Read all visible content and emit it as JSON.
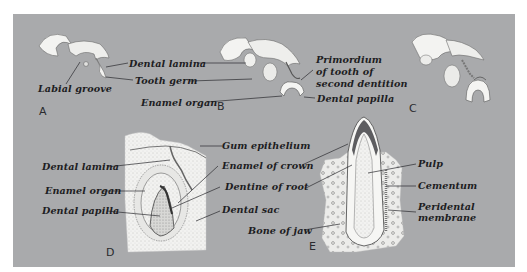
{
  "diagram": {
    "background_color": "#a9aaac",
    "panels": [
      {
        "id": "A",
        "label": "A",
        "annotations": [
          "Labial groove",
          "Dental lamina",
          "Tooth germ"
        ]
      },
      {
        "id": "B",
        "label": "B",
        "annotations": [
          "Enamel organ",
          "Primordium of tooth of second dentition",
          "Dental papilla"
        ]
      },
      {
        "id": "C",
        "label": "C",
        "annotations": []
      },
      {
        "id": "D",
        "label": "D",
        "annotations": [
          "Dental lamina",
          "Enamel organ",
          "Dental papilla",
          "Gum epithelium",
          "Enamel of crown",
          "Dentine of root",
          "Dental sac"
        ]
      },
      {
        "id": "E",
        "label": "E",
        "annotations": [
          "Pulp",
          "Cementum",
          "Peridental membrane",
          "Bone of jaw"
        ]
      }
    ]
  },
  "labels": {
    "labial_groove": "Labial groove",
    "dental_lamina_top": "Dental lamina",
    "tooth_germ": "Tooth germ",
    "enamel_organ_top": "Enamel organ",
    "primordium_1": "Primordium",
    "primordium_2": "of tooth of",
    "primordium_3": "second dentition",
    "dental_papilla_top": "Dental papilla",
    "gum_epithelium": "Gum epithelium",
    "dental_lamina_d": "Dental lamina",
    "enamel_of_crown": "Enamel of crown",
    "enamel_organ_d": "Enamel organ",
    "dentine_of_root": "Dentine of root",
    "dental_papilla_d": "Dental papilla",
    "dental_sac": "Dental sac",
    "bone_of_jaw": "Bone of jaw",
    "pulp": "Pulp",
    "cementum": "Cementum",
    "peridental_1": "Peridental",
    "peridental_2": "membrane"
  },
  "figure_letters": {
    "a": "A",
    "b": "B",
    "c": "C",
    "d": "D",
    "e": "E"
  }
}
